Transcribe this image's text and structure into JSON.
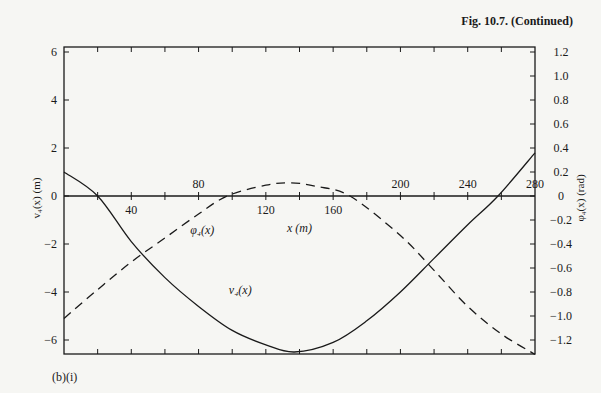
{
  "caption": "Fig. 10.7. (Continued)",
  "panel_label": "(b)(i)",
  "chart_data": {
    "type": "line",
    "title": "Fig. 10.7. (Continued)",
    "panel": "(b)(i)",
    "xlabel": "x (m)",
    "ylabel_left": "v4(x) (m)",
    "ylabel_right": "φ4(x) (rad)",
    "xlim": [
      0,
      280
    ],
    "ylim_left": [
      -6.6,
      6.2
    ],
    "ylim_right": [
      -1.32,
      1.24
    ],
    "x_ticks_above": [
      80,
      200,
      240,
      280
    ],
    "x_ticks_below": [
      40,
      120,
      160
    ],
    "x_tick_step": 20,
    "left_ticks": [
      6,
      4,
      2,
      0,
      -2,
      -4,
      -6
    ],
    "right_ticks": [
      "1.2",
      "1.0",
      "0.8",
      "0.6",
      "0.4",
      "0.2",
      "0",
      "-0.2",
      "-0.4",
      "-0.6",
      "-0.8",
      "-1.0",
      "-1.2"
    ],
    "grid": false,
    "series": [
      {
        "name": "v4(x)",
        "label": "v₄(x)",
        "axis": "left",
        "style": "solid",
        "x": [
          0,
          20,
          40,
          60,
          80,
          100,
          120,
          137,
          160,
          180,
          200,
          220,
          240,
          258,
          280
        ],
        "values": [
          1.0,
          0.0,
          -1.9,
          -3.4,
          -4.6,
          -5.6,
          -6.2,
          -6.5,
          -6.1,
          -5.2,
          -4.0,
          -2.6,
          -1.2,
          0.0,
          1.8
        ]
      },
      {
        "name": "phi4(x)",
        "label": "φ₄(x)",
        "axis": "right",
        "style": "dashed",
        "x": [
          0,
          20,
          40,
          60,
          80,
          97,
          120,
          135,
          150,
          170,
          200,
          220,
          240,
          260,
          280
        ],
        "values": [
          -1.02,
          -0.78,
          -0.55,
          -0.35,
          -0.15,
          0.0,
          0.09,
          0.11,
          0.08,
          0.0,
          -0.33,
          -0.62,
          -0.92,
          -1.15,
          -1.32
        ]
      }
    ],
    "annotations": [
      {
        "text": "φ₄(x)",
        "x": 75,
        "y_right": -0.32
      },
      {
        "text": "v₄(x)",
        "x": 98,
        "y_left": -4.1
      }
    ]
  }
}
